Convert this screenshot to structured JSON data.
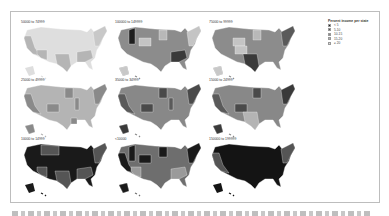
{
  "figure": {
    "legend": {
      "title": "Percent income per state",
      "items": [
        {
          "label": "< 5",
          "color": "#1a1a1a"
        },
        {
          "label": "5-10",
          "color": "#555555"
        },
        {
          "label": "10-15",
          "color": "#888888"
        },
        {
          "label": "15-20",
          "color": "#b4b4b4"
        },
        {
          "label": "≥ 20",
          "color": "#dcdcdc"
        }
      ]
    },
    "panels": [
      {
        "label": "50000 to 74999",
        "base": "#dedede",
        "accents": [
          [
            "ca",
            "#b5b5b5"
          ],
          [
            "az",
            "#b5b5b5"
          ],
          [
            "tx",
            "#b5b5b5"
          ],
          [
            "ne",
            "#c8c8c8"
          ],
          [
            "se",
            "#b5b5b5"
          ]
        ]
      },
      {
        "label": "100000 to 149999",
        "base": "#8c8c8c",
        "accents": [
          [
            "id",
            "#1f1f1f"
          ],
          [
            "wy",
            "#c4c4c4"
          ],
          [
            "mn",
            "#b8b8b8"
          ],
          [
            "se",
            "#3a3a3a"
          ],
          [
            "ne",
            "#c4c4c4"
          ],
          [
            "ak",
            "#c8c8c8"
          ]
        ]
      },
      {
        "label": "75000 to 99999",
        "base": "#8c8c8c",
        "accents": [
          [
            "wy",
            "#c4c4c4"
          ],
          [
            "co",
            "#c4c4c4"
          ],
          [
            "mn",
            "#b8b8b8"
          ],
          [
            "tx",
            "#3a3a3a"
          ],
          [
            "ak",
            "#c8c8c8"
          ],
          [
            "ne",
            "#5a5a5a"
          ]
        ]
      },
      {
        "label": "25000 to 49999",
        "base": "#b4b4b4",
        "accents": [
          [
            "ca",
            "#8a8a8a"
          ],
          [
            "co",
            "#8a8a8a"
          ],
          [
            "mn",
            "#8a8a8a"
          ],
          [
            "il",
            "#8a8a8a"
          ],
          [
            "ne",
            "#8a8a8a"
          ],
          [
            "la",
            "#8a8a8a"
          ],
          [
            "ak",
            "#8a8a8a"
          ]
        ]
      },
      {
        "label": "35000 to 34999",
        "base": "#888888",
        "accents": [
          [
            "ca",
            "#5a5a5a"
          ],
          [
            "co",
            "#4a4a4a"
          ],
          [
            "mn",
            "#4a4a4a"
          ],
          [
            "ne",
            "#4a4a4a"
          ],
          [
            "il",
            "#5a5a5a"
          ],
          [
            "ak",
            "#3a3a3a"
          ]
        ]
      },
      {
        "label": "15000 to 24999",
        "base": "#888888",
        "accents": [
          [
            "ca",
            "#5a5a5a"
          ],
          [
            "co",
            "#4a4a4a"
          ],
          [
            "mn",
            "#4a4a4a"
          ],
          [
            "tx",
            "#b4b4b4"
          ],
          [
            "ne",
            "#3a3a3a"
          ],
          [
            "ak",
            "#3a3a3a"
          ]
        ]
      },
      {
        "label": "10000 to 14999",
        "base": "#1a1a1a",
        "accents": [
          [
            "mt",
            "#555555"
          ],
          [
            "az",
            "#555555"
          ],
          [
            "tx",
            "#555555"
          ],
          [
            "se",
            "#555555"
          ],
          [
            "ne",
            "#555555"
          ]
        ]
      },
      {
        "label": "<10000",
        "base": "#6e6e6e",
        "accents": [
          [
            "ca",
            "#1a1a1a"
          ],
          [
            "id",
            "#1a1a1a"
          ],
          [
            "wy",
            "#1a1a1a"
          ],
          [
            "mn",
            "#1a1a1a"
          ],
          [
            "az",
            "#9a9a9a"
          ],
          [
            "se",
            "#9a9a9a"
          ],
          [
            "ne",
            "#1a1a1a"
          ],
          [
            "ak",
            "#1a1a1a"
          ]
        ]
      },
      {
        "label": "150000 to 199999",
        "base": "#141414",
        "accents": [
          [
            "ca",
            "#555555"
          ],
          [
            "ne",
            "#555555"
          ]
        ]
      }
    ],
    "caption": ""
  }
}
